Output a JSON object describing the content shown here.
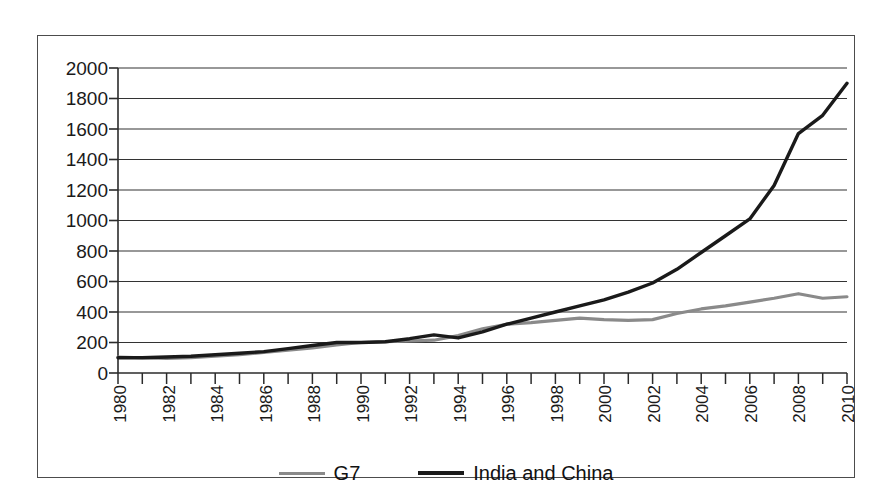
{
  "chart_data": {
    "type": "line",
    "title": "",
    "subtitle": "",
    "xlabel": "",
    "ylabel": "",
    "xlim": [
      1980,
      2010
    ],
    "ylim": [
      0,
      2000
    ],
    "grid": true,
    "legend_position": "bottom",
    "x": [
      1980,
      1981,
      1982,
      1983,
      1984,
      1985,
      1986,
      1987,
      1988,
      1989,
      1990,
      1991,
      1992,
      1993,
      1994,
      1995,
      1996,
      1997,
      1998,
      1999,
      2000,
      2001,
      2002,
      2003,
      2004,
      2005,
      2006,
      2007,
      2008,
      2009,
      2010
    ],
    "x_tick_labels": [
      "1980",
      "1982",
      "1984",
      "1986",
      "1988",
      "1990",
      "1992",
      "1994",
      "1996",
      "1998",
      "2000",
      "2002",
      "2004",
      "2006",
      "2008",
      "2010"
    ],
    "y_tick_labels": [
      "2000",
      "1800",
      "1600",
      "1400",
      "1200",
      "1000",
      "800",
      "600",
      "400",
      "200",
      "0"
    ],
    "y_ticks": [
      0,
      200,
      400,
      600,
      800,
      1000,
      1200,
      1400,
      1600,
      1800,
      2000
    ],
    "series": [
      {
        "name": "G7",
        "color": "#8a8a8a",
        "values": [
          105,
          100,
          95,
          100,
          110,
          120,
          135,
          150,
          165,
          185,
          200,
          205,
          210,
          215,
          245,
          290,
          320,
          330,
          345,
          360,
          350,
          345,
          350,
          390,
          420,
          440,
          465,
          490,
          520,
          490,
          500
        ]
      },
      {
        "name": "India and China",
        "color": "#1a1a1a",
        "values": [
          100,
          100,
          105,
          110,
          120,
          130,
          140,
          160,
          180,
          200,
          200,
          205,
          225,
          250,
          230,
          270,
          320,
          360,
          400,
          440,
          480,
          530,
          590,
          680,
          790,
          900,
          1010,
          1230,
          1570,
          1690,
          1900
        ]
      }
    ]
  },
  "legend": {
    "entries": [
      {
        "label": "G7",
        "swatch": "gray-line-swatch"
      },
      {
        "label": "India and China",
        "swatch": "black-line-swatch"
      }
    ]
  },
  "axes": {
    "y_labels": [
      "2000",
      "1800",
      "1600",
      "1400",
      "1200",
      "1000",
      "800",
      "600",
      "400",
      "200",
      "0"
    ],
    "x_labels": [
      "1980",
      "1982",
      "1984",
      "1986",
      "1988",
      "1990",
      "1992",
      "1994",
      "1996",
      "1998",
      "2000",
      "2002",
      "2004",
      "2006",
      "2008",
      "2010"
    ]
  },
  "colors": {
    "g7_line": "#8a8a8a",
    "india_china_line": "#1a1a1a",
    "gridline": "#333333",
    "frame": "#4c4c4c",
    "background": "#ffffff"
  }
}
